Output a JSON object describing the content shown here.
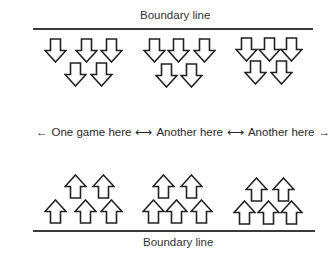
{
  "diagram": {
    "top_boundary": {
      "label": "Boundary line",
      "line_y": 28,
      "line_x1": 33,
      "line_x2": 313,
      "label_x": 140,
      "label_y": 9
    },
    "bottom_boundary": {
      "label": "Boundary line",
      "line_y": 230,
      "line_x1": 33,
      "line_x2": 315,
      "label_x": 143,
      "label_y": 236
    },
    "middle_row": {
      "items": [
        {
          "text": "One game here",
          "arrow_before": "←"
        },
        {
          "text": "Another here",
          "arrow_before": "⟷"
        },
        {
          "text": "Another here",
          "arrow_before": "⟷",
          "arrow_after": "→"
        }
      ]
    },
    "arrow_groups": [
      {
        "name": "top-group-1",
        "direction": "down",
        "positions": [
          [
            44,
            38
          ],
          [
            75,
            38
          ],
          [
            100,
            38
          ],
          [
            64,
            62
          ],
          [
            90,
            62
          ]
        ]
      },
      {
        "name": "top-group-2",
        "direction": "down",
        "positions": [
          [
            143,
            38
          ],
          [
            167,
            38
          ],
          [
            193,
            38
          ],
          [
            155,
            63
          ],
          [
            180,
            63
          ]
        ]
      },
      {
        "name": "top-group-3",
        "direction": "down",
        "positions": [
          [
            235,
            37
          ],
          [
            258,
            37
          ],
          [
            280,
            37
          ],
          [
            244,
            60
          ],
          [
            270,
            60
          ]
        ]
      },
      {
        "name": "bottom-group-1",
        "direction": "up",
        "positions": [
          [
            64,
            174
          ],
          [
            92,
            174
          ],
          [
            44,
            199
          ],
          [
            74,
            199
          ],
          [
            100,
            199
          ]
        ]
      },
      {
        "name": "bottom-group-2",
        "direction": "up",
        "positions": [
          [
            152,
            174
          ],
          [
            180,
            174
          ],
          [
            142,
            199
          ],
          [
            165,
            199
          ],
          [
            190,
            199
          ]
        ]
      },
      {
        "name": "bottom-group-3",
        "direction": "up",
        "positions": [
          [
            245,
            177
          ],
          [
            272,
            177
          ],
          [
            233,
            200
          ],
          [
            257,
            200
          ],
          [
            280,
            200
          ]
        ]
      }
    ]
  }
}
